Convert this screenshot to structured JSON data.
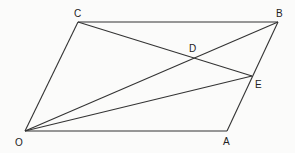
{
  "diagram": {
    "type": "geometry",
    "points": {
      "O": {
        "x": 25,
        "y": 131,
        "label": "O",
        "lx": 15,
        "ly": 146
      },
      "A": {
        "x": 227,
        "y": 131,
        "label": "A",
        "lx": 223,
        "ly": 145
      },
      "B": {
        "x": 278,
        "y": 22,
        "label": "B",
        "lx": 276,
        "ly": 17
      },
      "C": {
        "x": 78,
        "y": 22,
        "label": "C",
        "lx": 74,
        "ly": 17
      },
      "D": {
        "x": 195,
        "y": 59,
        "label": "D",
        "lx": 189,
        "ly": 52
      },
      "E": {
        "x": 252,
        "y": 76,
        "label": "E",
        "lx": 255,
        "ly": 88
      }
    },
    "segments": [
      [
        "O",
        "A"
      ],
      [
        "A",
        "B"
      ],
      [
        "B",
        "C"
      ],
      [
        "C",
        "O"
      ],
      [
        "O",
        "B"
      ],
      [
        "C",
        "E"
      ],
      [
        "O",
        "E"
      ]
    ]
  }
}
